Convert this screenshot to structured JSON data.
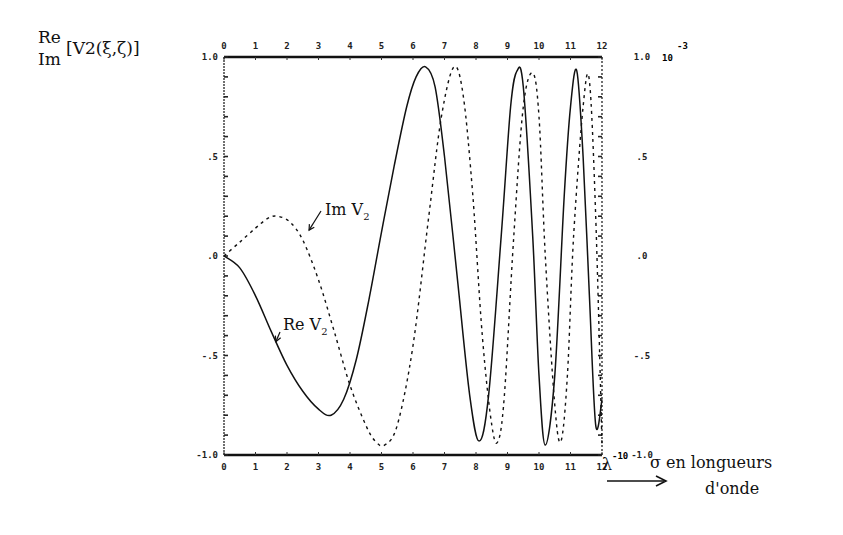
{
  "chart_data": {
    "type": "line",
    "title": "",
    "ylabel": {
      "top": "Re",
      "bottom": "Im",
      "expression": "[V2(ξ,ζ)]"
    },
    "xlabel": {
      "prefix": "σ en longueurs",
      "suffix": "d'onde",
      "unit_marker": "λ",
      "unit_exponent": "-10"
    },
    "right_axis_multiplier": "10",
    "right_axis_exponent": "-3",
    "xlim": [
      0,
      12
    ],
    "ylim": [
      -1.0,
      1.0
    ],
    "x_ticks": [
      "0",
      "1",
      "2",
      "3",
      "4",
      "5",
      "6",
      "7",
      "8",
      "9",
      "10",
      "11",
      "12"
    ],
    "y_ticks_left": [
      {
        "value": 1.0,
        "label": "1.0"
      },
      {
        "value": 0.5,
        "label": ".5"
      },
      {
        "value": 0.0,
        "label": ".0"
      },
      {
        "value": -0.5,
        "label": "-.5"
      },
      {
        "value": -1.0,
        "label": "-1.0"
      }
    ],
    "y_ticks_right": [
      {
        "value": 1.0,
        "label": "1.0"
      },
      {
        "value": 0.5,
        "label": ".5"
      },
      {
        "value": 0.0,
        "label": ".0"
      },
      {
        "value": -0.5,
        "label": "-.5"
      },
      {
        "value": -1.0,
        "label": "-1.0"
      }
    ],
    "grid": false,
    "series": [
      {
        "name": "Re V2",
        "style": "solid",
        "x": [
          0,
          0.5,
          1.0,
          1.5,
          2.0,
          2.5,
          3.0,
          3.4,
          3.8,
          4.2,
          4.6,
          5.0,
          5.4,
          5.8,
          6.1,
          6.4,
          6.7,
          7.0,
          7.4,
          7.8,
          8.1,
          8.4,
          8.8,
          9.1,
          9.3,
          9.5,
          9.8,
          10.0,
          10.2,
          10.5,
          10.8,
          11.0,
          11.2,
          11.4,
          11.6,
          11.8,
          12.0
        ],
        "y": [
          0.0,
          -0.06,
          -0.2,
          -0.38,
          -0.55,
          -0.68,
          -0.77,
          -0.8,
          -0.72,
          -0.52,
          -0.22,
          0.12,
          0.45,
          0.75,
          0.9,
          0.95,
          0.85,
          0.5,
          -0.1,
          -0.7,
          -0.93,
          -0.7,
          0.1,
          0.75,
          0.93,
          0.85,
          0.1,
          -0.6,
          -0.95,
          -0.6,
          0.3,
          0.75,
          0.93,
          0.5,
          -0.2,
          -0.85,
          -0.72
        ]
      },
      {
        "name": "Im V2",
        "style": "dashed",
        "x": [
          0,
          0.5,
          1.0,
          1.4,
          1.7,
          2.1,
          2.5,
          3.0,
          3.5,
          4.0,
          4.5,
          4.8,
          5.1,
          5.5,
          6.0,
          6.5,
          6.9,
          7.3,
          7.6,
          7.9,
          8.2,
          8.5,
          8.7,
          8.9,
          9.2,
          9.5,
          9.8,
          10.0,
          10.2,
          10.5,
          10.7,
          10.9,
          11.1,
          11.4,
          11.6,
          11.8,
          12.0
        ],
        "y": [
          0.0,
          0.07,
          0.14,
          0.19,
          0.2,
          0.17,
          0.08,
          -0.12,
          -0.38,
          -0.65,
          -0.85,
          -0.93,
          -0.95,
          -0.85,
          -0.45,
          0.2,
          0.7,
          0.95,
          0.8,
          0.3,
          -0.4,
          -0.85,
          -0.93,
          -0.7,
          0.1,
          0.75,
          0.92,
          0.7,
          0.0,
          -0.75,
          -0.93,
          -0.6,
          0.1,
          0.75,
          0.88,
          0.2,
          -0.95
        ]
      }
    ],
    "annotations": [
      {
        "text": "Im V",
        "subscript": "2",
        "target_series": "Im V2",
        "x": 2.7,
        "y": 0.13
      },
      {
        "text": "Re V",
        "subscript": "2",
        "target_series": "Re V2",
        "x": 1.65,
        "y": -0.43
      }
    ]
  }
}
